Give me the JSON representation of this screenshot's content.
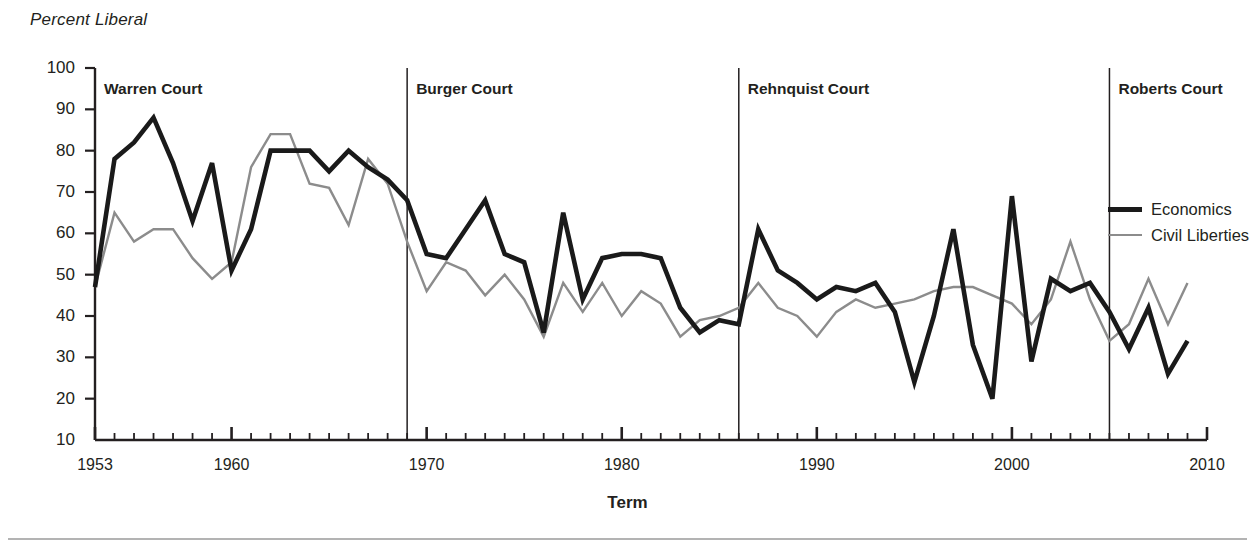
{
  "axis": {
    "y_title": "Percent Liberal",
    "x_title": "Term",
    "y_ticks": [
      100,
      90,
      80,
      70,
      60,
      50,
      40,
      30,
      20,
      10
    ],
    "x_ticks": [
      1953,
      1960,
      1970,
      1980,
      1990,
      2000,
      2010
    ]
  },
  "legend": {
    "items": [
      {
        "label": "Economics",
        "color": "#1a1a1a"
      },
      {
        "label": "Civil Liberties",
        "color": "#8c8c8c"
      }
    ]
  },
  "eras": [
    {
      "name": "Warren Court",
      "start": 1953,
      "end": 1968
    },
    {
      "name": "Burger Court",
      "start": 1969,
      "end": 1985
    },
    {
      "name": "Rehnquist Court",
      "start": 1986,
      "end": 2004
    },
    {
      "name": "Roberts Court",
      "start": 2005,
      "end": 2009
    }
  ],
  "chart_data": {
    "type": "line",
    "title": "",
    "xlabel": "Term",
    "ylabel": "Percent Liberal",
    "xlim": [
      1953,
      2010
    ],
    "ylim": [
      10,
      100
    ],
    "grid": false,
    "legend_position": "right",
    "x": [
      1953,
      1954,
      1955,
      1956,
      1957,
      1958,
      1959,
      1960,
      1961,
      1962,
      1963,
      1964,
      1965,
      1966,
      1967,
      1968,
      1969,
      1970,
      1971,
      1972,
      1973,
      1974,
      1975,
      1976,
      1977,
      1978,
      1979,
      1980,
      1981,
      1982,
      1983,
      1984,
      1985,
      1986,
      1987,
      1988,
      1989,
      1990,
      1991,
      1992,
      1993,
      1994,
      1995,
      1996,
      1997,
      1998,
      1999,
      2000,
      2001,
      2002,
      2003,
      2004,
      2005,
      2006,
      2007,
      2008,
      2009
    ],
    "series": [
      {
        "name": "Economics",
        "color": "#1a1a1a",
        "width": 4.6,
        "values": [
          47,
          78,
          82,
          88,
          77,
          63,
          77,
          51,
          61,
          80,
          80,
          80,
          75,
          80,
          76,
          73,
          68,
          55,
          54,
          61,
          68,
          55,
          53,
          36,
          65,
          44,
          54,
          55,
          55,
          54,
          42,
          36,
          39,
          38,
          61,
          51,
          48,
          44,
          47,
          46,
          48,
          41,
          24,
          40,
          61,
          33,
          20,
          69,
          29,
          49,
          46,
          48,
          41,
          32,
          42,
          26,
          34
        ]
      },
      {
        "name": "Civil Liberties",
        "color": "#8c8c8c",
        "width": 2.4,
        "values": [
          47,
          65,
          58,
          61,
          61,
          54,
          49,
          53,
          76,
          84,
          84,
          72,
          71,
          62,
          78,
          72,
          58,
          46,
          53,
          51,
          45,
          50,
          44,
          35,
          48,
          41,
          48,
          40,
          46,
          43,
          35,
          39,
          40,
          42,
          48,
          42,
          40,
          35,
          41,
          44,
          42,
          43,
          44,
          46,
          47,
          47,
          45,
          43,
          38,
          44,
          58,
          44,
          34,
          38,
          49,
          38,
          48
        ]
      }
    ]
  }
}
